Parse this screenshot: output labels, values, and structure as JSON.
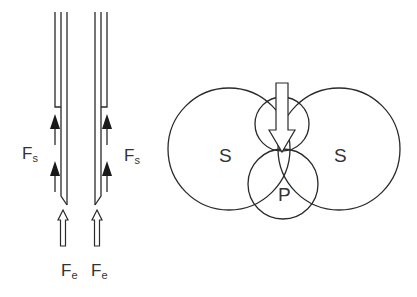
{
  "labels": {
    "fs_left": {
      "main": "F",
      "sub": "s"
    },
    "fs_right": {
      "main": "F",
      "sub": "s"
    },
    "fe_left": {
      "main": "F",
      "sub": "e"
    },
    "fe_right": {
      "main": "F",
      "sub": "e"
    },
    "s_left": "S",
    "s_right": "S",
    "p": "P"
  },
  "colors": {
    "line": "#2a2a2a",
    "text": "#333333",
    "background": "#ffffff"
  }
}
